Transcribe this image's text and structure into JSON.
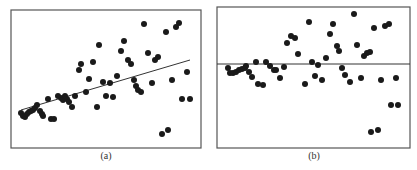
{
  "figure": {
    "panels": [
      {
        "id": "a",
        "caption": "(a)"
      },
      {
        "id": "b",
        "caption": "(b)"
      }
    ]
  },
  "chart_data": [
    {
      "type": "scatter",
      "title": "(a)",
      "xlabel": "",
      "ylabel": "",
      "grid": false,
      "legend": null,
      "annotations": [
        "fitted regression line (positive slope)"
      ],
      "frame_px": {
        "x0": 11,
        "y0": 10,
        "x1": 201,
        "y1": 148
      },
      "line_px": {
        "x0": 21,
        "y0": 110,
        "x1": 190,
        "y1": 60
      },
      "points_px": [
        [
          21,
          113
        ],
        [
          23,
          116
        ],
        [
          25,
          117
        ],
        [
          27,
          114
        ],
        [
          29,
          112
        ],
        [
          31,
          111
        ],
        [
          33,
          110
        ],
        [
          35,
          108
        ],
        [
          37,
          105
        ],
        [
          40,
          111
        ],
        [
          42,
          114
        ],
        [
          43,
          116
        ],
        [
          48,
          99
        ],
        [
          51,
          119
        ],
        [
          54,
          119
        ],
        [
          58,
          96
        ],
        [
          61,
          98
        ],
        [
          63,
          100
        ],
        [
          65,
          96
        ],
        [
          67,
          99
        ],
        [
          69,
          102
        ],
        [
          72,
          107
        ],
        [
          75,
          96
        ],
        [
          79,
          70
        ],
        [
          81,
          64
        ],
        [
          86,
          92
        ],
        [
          89,
          79
        ],
        [
          93,
          62
        ],
        [
          99,
          45
        ],
        [
          97,
          107
        ],
        [
          103,
          82
        ],
        [
          106,
          96
        ],
        [
          110,
          83
        ],
        [
          113,
          97
        ],
        [
          117,
          76
        ],
        [
          121,
          51
        ],
        [
          124,
          41
        ],
        [
          128,
          60
        ],
        [
          131,
          64
        ],
        [
          134,
          80
        ],
        [
          136,
          86
        ],
        [
          138,
          90
        ],
        [
          141,
          92
        ],
        [
          144,
          24
        ],
        [
          148,
          53
        ],
        [
          152,
          83
        ],
        [
          155,
          60
        ],
        [
          158,
          57
        ],
        [
          162,
          134
        ],
        [
          168,
          130
        ],
        [
          166,
          32
        ],
        [
          172,
          80
        ],
        [
          176,
          27
        ],
        [
          179,
          23
        ],
        [
          182,
          99
        ],
        [
          187,
          72
        ],
        [
          190,
          99
        ]
      ]
    },
    {
      "type": "scatter",
      "title": "(b)",
      "xlabel": "",
      "ylabel": "",
      "grid": false,
      "legend": null,
      "annotations": [
        "horizontal reference line (residuals at zero)"
      ],
      "frame_px": {
        "x0": 217,
        "y0": 7,
        "x1": 410,
        "y1": 148
      },
      "line_px": {
        "x0": 217,
        "y0": 64,
        "x1": 410,
        "y1": 64
      },
      "points_px": [
        [
          228,
          68
        ],
        [
          230,
          73
        ],
        [
          233,
          73
        ],
        [
          236,
          72
        ],
        [
          239,
          70
        ],
        [
          242,
          69
        ],
        [
          245,
          68
        ],
        [
          246,
          66
        ],
        [
          249,
          72
        ],
        [
          252,
          77
        ],
        [
          258,
          84
        ],
        [
          263,
          85
        ],
        [
          256,
          62
        ],
        [
          266,
          62
        ],
        [
          270,
          66
        ],
        [
          274,
          70
        ],
        [
          276,
          70
        ],
        [
          280,
          78
        ],
        [
          284,
          67
        ],
        [
          287,
          43
        ],
        [
          291,
          36
        ],
        [
          295,
          38
        ],
        [
          298,
          54
        ],
        [
          305,
          84
        ],
        [
          309,
          22
        ],
        [
          312,
          62
        ],
        [
          315,
          76
        ],
        [
          318,
          65
        ],
        [
          322,
          80
        ],
        [
          326,
          58
        ],
        [
          330,
          34
        ],
        [
          333,
          24
        ],
        [
          337,
          46
        ],
        [
          339,
          51
        ],
        [
          342,
          68
        ],
        [
          345,
          75
        ],
        [
          350,
          82
        ],
        [
          354,
          14
        ],
        [
          357,
          45
        ],
        [
          361,
          78
        ],
        [
          364,
          56
        ],
        [
          367,
          53
        ],
        [
          370,
          52
        ],
        [
          371,
          132
        ],
        [
          378,
          130
        ],
        [
          374,
          28
        ],
        [
          381,
          80
        ],
        [
          385,
          26
        ],
        [
          389,
          24
        ],
        [
          391,
          105
        ],
        [
          398,
          105
        ],
        [
          396,
          78
        ]
      ]
    }
  ],
  "colors": {
    "point": "#1a1a1a",
    "frame": "#555555",
    "line": "#333333",
    "background": "#ffffff"
  }
}
